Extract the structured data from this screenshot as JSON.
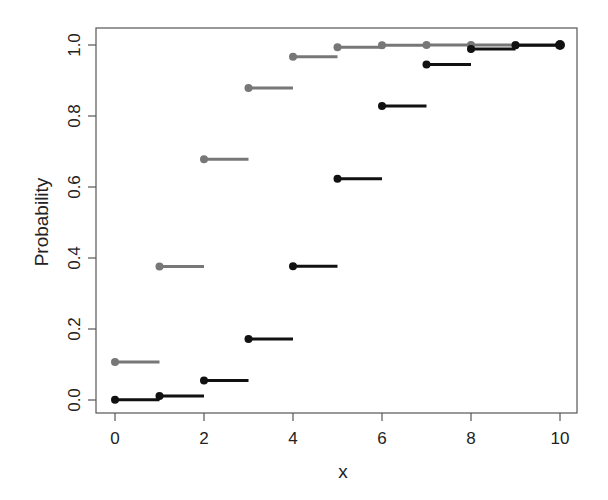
{
  "chart_data": {
    "type": "line",
    "subtype": "step-cdf",
    "title": "",
    "xlabel": "x",
    "ylabel": "Probability",
    "xlim": [
      -0.4,
      10.4
    ],
    "ylim": [
      -0.035,
      1.04
    ],
    "x_ticks": [
      0,
      2,
      4,
      6,
      8,
      10
    ],
    "x_tick_labels": [
      "0",
      "2",
      "4",
      "6",
      "8",
      "10"
    ],
    "y_ticks": [
      0.0,
      0.2,
      0.4,
      0.6,
      0.8,
      1.0
    ],
    "y_tick_labels": [
      "0.0",
      "0.2",
      "0.4",
      "0.6",
      "0.8",
      "1.0"
    ],
    "grid": false,
    "legend": null,
    "x": [
      0,
      1,
      2,
      3,
      4,
      5,
      6,
      7,
      8,
      9,
      10
    ],
    "series": [
      {
        "name": "Binomial(10, 0.2) CDF",
        "color": "#777777",
        "values": [
          0.107,
          0.376,
          0.678,
          0.879,
          0.967,
          0.994,
          0.999,
          1.0,
          1.0,
          1.0,
          1.0
        ]
      },
      {
        "name": "Binomial(10, 0.5) CDF",
        "color": "#111111",
        "values": [
          0.001,
          0.011,
          0.055,
          0.172,
          0.377,
          0.623,
          0.828,
          0.945,
          0.989,
          0.999,
          1.0
        ]
      }
    ]
  }
}
